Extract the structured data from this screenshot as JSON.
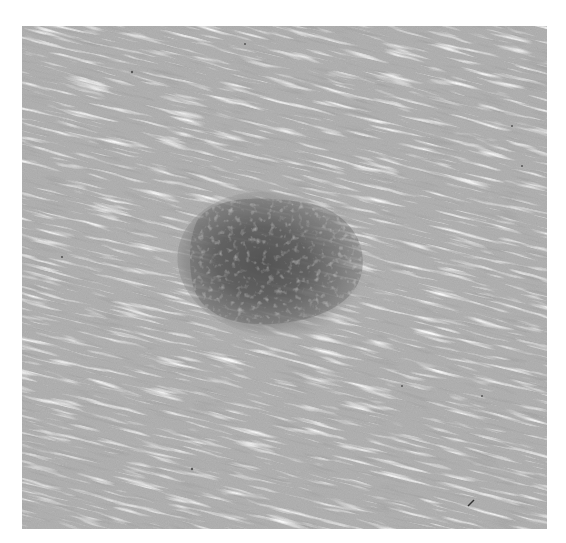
{
  "image": {
    "description": "Grayscale close-up photograph of a pigmented skin lesion (mole) on finely textured skin",
    "subject": "pigmented skin lesion",
    "background_color": "#ffffff",
    "colors": {
      "skin": "#adadad",
      "skin_highlight": "#d8d8d8",
      "skin_shadow": "#9a9a9a",
      "lesion_core": "#5a5a5a",
      "lesion_edge": "#8a8a8a"
    },
    "lesion": {
      "center": [
        265,
        265
      ],
      "approx_width": 165,
      "approx_height": 125
    }
  }
}
